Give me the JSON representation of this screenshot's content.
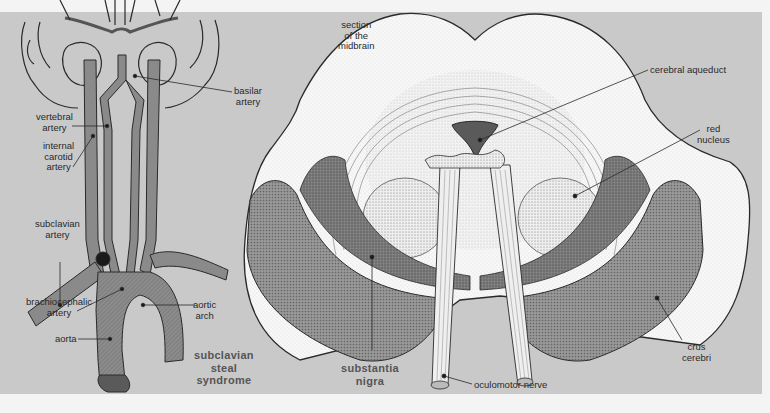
{
  "figure": {
    "left_panel": {
      "caption": [
        "subclavian",
        "steal",
        "syndrome"
      ],
      "labels": {
        "basilar_artery": [
          "basilar",
          "artery"
        ],
        "vertebral_artery": [
          "vertebral",
          "artery"
        ],
        "internal_carotid_artery": [
          "internal",
          "carotid",
          "artery"
        ],
        "subclavian_artery": [
          "subclavian",
          "artery"
        ],
        "brachiocephalic_artery": [
          "brachiocephalic",
          "artery"
        ],
        "aortic_arch": [
          "aortic",
          "arch"
        ],
        "aorta": "aorta"
      }
    },
    "right_panel": {
      "title": [
        "section",
        "of the",
        "midbrain"
      ],
      "labels": {
        "cerebral_aqueduct": "cerebral aqueduct",
        "red_nucleus": [
          "red",
          "nucleus"
        ],
        "crus_cerebri": [
          "crus",
          "cerebri"
        ],
        "oculomotor_nerve": "oculomotor nerve"
      },
      "bold_label": [
        "substantia",
        "nigra"
      ]
    },
    "colors": {
      "panel_background": "#c9c9c9",
      "page_background": "#f4f4f4",
      "vessel_fill": "#8a8a8a",
      "outline": "#2a2a2a",
      "tissue_white": "#f7f7f7",
      "dark_stipple": "#6e6e6e",
      "caption_gray": "#555555"
    }
  }
}
